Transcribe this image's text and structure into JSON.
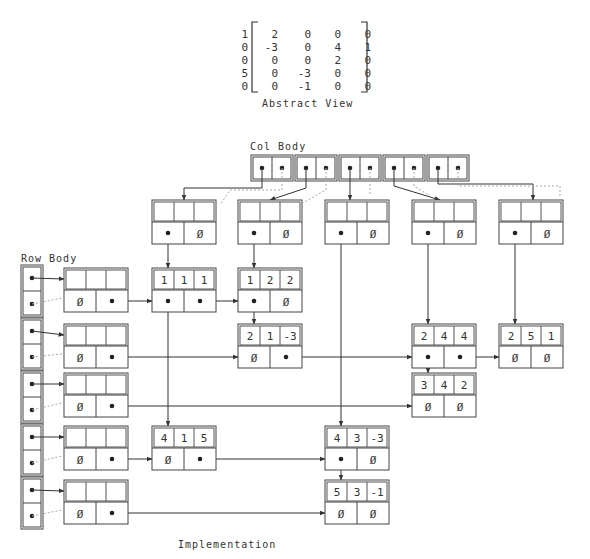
{
  "title_abstract": "Abstract View",
  "title_col_body": "Col Body",
  "title_row_body": "Row Body",
  "title_implementation": "Implementation",
  "matrix": [
    [
      "1",
      "2",
      "0",
      "0",
      "0"
    ],
    [
      "0",
      "-3",
      "0",
      "4",
      "1"
    ],
    [
      "0",
      "0",
      "0",
      "2",
      "0"
    ],
    [
      "5",
      "0",
      "-3",
      "0",
      "0"
    ],
    [
      "0",
      "0",
      "-1",
      "0",
      "0"
    ]
  ],
  "null_symbol": "Ø",
  "col_headers": [
    {
      "x": 152,
      "label": ""
    },
    {
      "x": 238,
      "label": ""
    },
    {
      "x": 325,
      "label": ""
    },
    {
      "x": 412,
      "label": ""
    },
    {
      "x": 499,
      "label": ""
    }
  ],
  "row_headers": [
    {
      "y": 268
    },
    {
      "y": 324
    },
    {
      "y": 373
    },
    {
      "y": 426
    },
    {
      "y": 480
    }
  ],
  "nodes": [
    {
      "id": "n111",
      "x": 152,
      "y": 268,
      "vals": [
        "1",
        "1",
        "1"
      ],
      "down": "ptr",
      "right": "ptr"
    },
    {
      "id": "n122",
      "x": 238,
      "y": 268,
      "vals": [
        "1",
        "2",
        "2"
      ],
      "down": "ptr",
      "right": "Ø"
    },
    {
      "id": "n21m3",
      "x": 238,
      "y": 324,
      "vals": [
        "2",
        "1",
        "-3"
      ],
      "down": "Ø",
      "right": "ptr"
    },
    {
      "id": "n244",
      "x": 412,
      "y": 324,
      "vals": [
        "2",
        "4",
        "4"
      ],
      "down": "ptr",
      "right": "ptr"
    },
    {
      "id": "n251",
      "x": 499,
      "y": 324,
      "vals": [
        "2",
        "5",
        "1"
      ],
      "down": "Ø",
      "right": "Ø"
    },
    {
      "id": "n342",
      "x": 412,
      "y": 373,
      "vals": [
        "3",
        "4",
        "2"
      ],
      "down": "Ø",
      "right": "Ø"
    },
    {
      "id": "n415",
      "x": 152,
      "y": 426,
      "vals": [
        "4",
        "1",
        "5"
      ],
      "down": "Ø",
      "right": "ptr"
    },
    {
      "id": "n43m3",
      "x": 325,
      "y": 426,
      "vals": [
        "4",
        "3",
        "-3"
      ],
      "down": "ptr",
      "right": "Ø"
    },
    {
      "id": "n53m1",
      "x": 325,
      "y": 480,
      "vals": [
        "5",
        "3",
        "-1"
      ],
      "down": "Ø",
      "right": "Ø"
    }
  ],
  "colors": {
    "line": "#333333",
    "box": "#444444",
    "faint": "#aaaaaa"
  }
}
